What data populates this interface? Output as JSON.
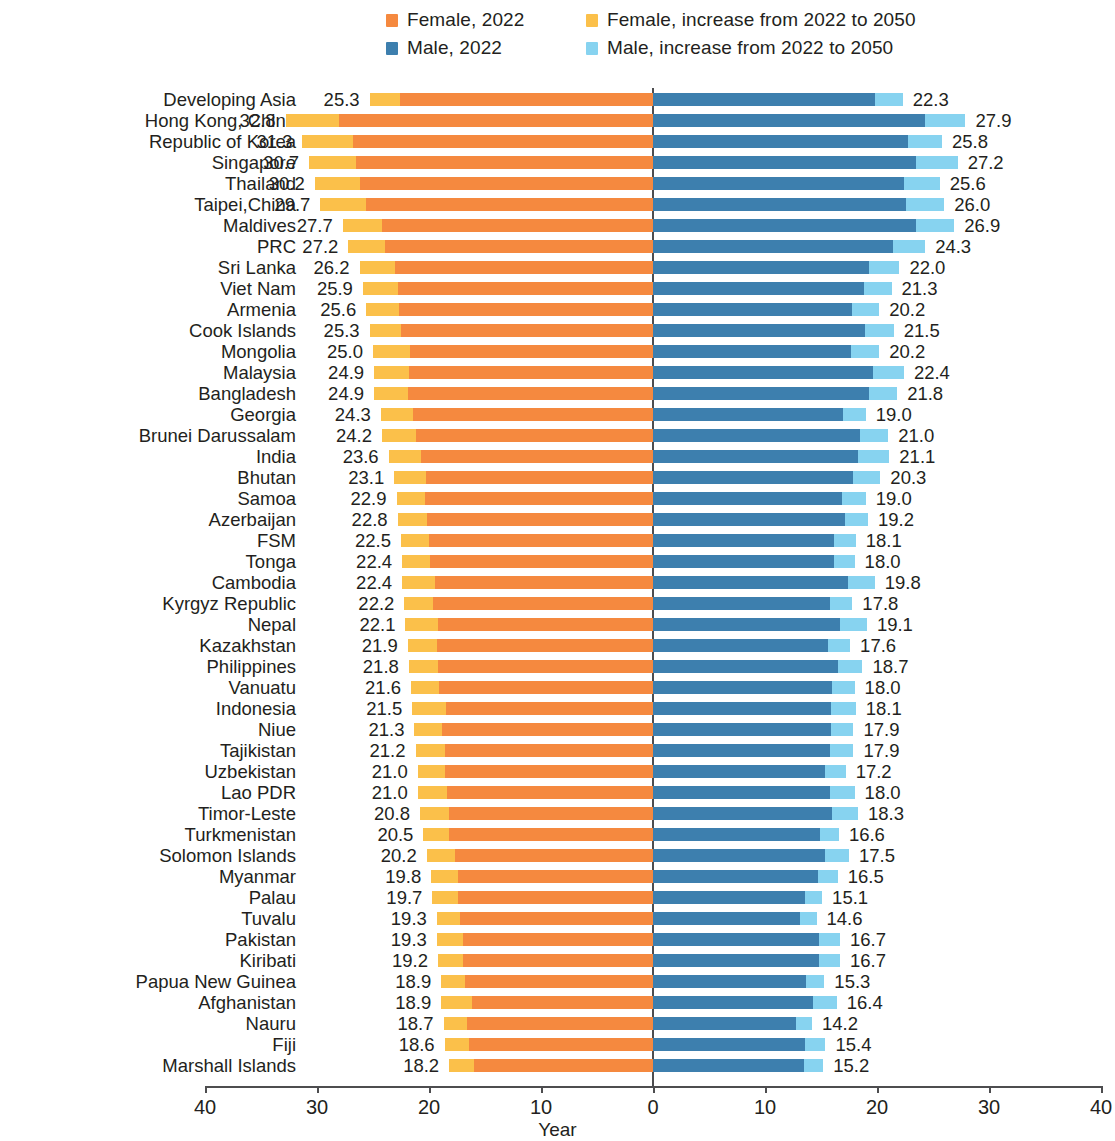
{
  "legend": {
    "items": [
      {
        "label": "Female, 2022",
        "color": "#f5893f"
      },
      {
        "label": "Female, increase from 2022 to 2050",
        "color": "#fbc04a"
      },
      {
        "label": "Male, 2022",
        "color": "#3d7fae"
      },
      {
        "label": "Male, increase from 2022 to 2050",
        "color": "#87d3f0"
      }
    ]
  },
  "axis": {
    "title": "Year",
    "ticks": [
      "40",
      "30",
      "20",
      "10",
      "0",
      "10",
      "20",
      "30",
      "40"
    ]
  },
  "chart_data": {
    "type": "bar",
    "subtype": "diverging-stacked-horizontal",
    "title": "",
    "xlabel": "Year",
    "ylabel": "",
    "xlim": [
      -40,
      40
    ],
    "grid": false,
    "legend_position": "top",
    "axis_ticks": [
      40,
      30,
      20,
      10,
      0,
      10,
      20,
      30,
      40
    ],
    "series": [
      {
        "name": "Female, 2022",
        "color": "#f5893f",
        "side": "left"
      },
      {
        "name": "Female, increase from 2022 to 2050",
        "color": "#fbc04a",
        "side": "left"
      },
      {
        "name": "Male, 2022",
        "color": "#3d7fae",
        "side": "right"
      },
      {
        "name": "Male, increase from 2022 to 2050",
        "color": "#87d3f0",
        "side": "right"
      }
    ],
    "categories": [
      "Developing Asia",
      "Hong Kong, China",
      "Republic of Korea",
      "Singapore",
      "Thailand",
      "Taipei,China",
      "Maldives",
      "PRC",
      "Sri Lanka",
      "Viet Nam",
      "Armenia",
      "Cook Islands",
      "Mongolia",
      "Malaysia",
      "Bangladesh",
      "Georgia",
      "Brunei Darussalam",
      "India",
      "Bhutan",
      "Samoa",
      "Azerbaijan",
      "FSM",
      "Tonga",
      "Cambodia",
      "Kyrgyz Republic",
      "Nepal",
      "Kazakhstan",
      "Philippines",
      "Vanuatu",
      "Indonesia",
      "Niue",
      "Tajikistan",
      "Uzbekistan",
      "Lao PDR",
      "Timor-Leste",
      "Turkmenistan",
      "Solomon Islands",
      "Myanmar",
      "Palau",
      "Tuvalu",
      "Pakistan",
      "Kiribati",
      "Papua New Guinea",
      "Afghanistan",
      "Nauru",
      "Fiji",
      "Marshall Islands"
    ],
    "female_total_2050": [
      25.3,
      32.8,
      31.3,
      30.7,
      30.2,
      29.7,
      27.7,
      27.2,
      26.2,
      25.9,
      25.6,
      25.3,
      25.0,
      24.9,
      24.9,
      24.3,
      24.2,
      23.6,
      23.1,
      22.9,
      22.8,
      22.5,
      22.4,
      22.4,
      22.2,
      22.1,
      21.9,
      21.8,
      21.6,
      21.5,
      21.3,
      21.2,
      21.0,
      21.0,
      20.8,
      20.5,
      20.2,
      19.8,
      19.7,
      19.3,
      19.3,
      19.2,
      18.9,
      18.9,
      18.7,
      18.6,
      18.2
    ],
    "female_2022": [
      22.6,
      28.0,
      26.8,
      26.5,
      26.2,
      25.6,
      24.2,
      23.9,
      23.0,
      22.8,
      22.7,
      22.5,
      21.7,
      21.8,
      21.9,
      21.4,
      21.2,
      20.7,
      20.3,
      20.4,
      20.2,
      20.0,
      19.9,
      19.5,
      19.6,
      19.2,
      19.3,
      19.2,
      19.1,
      18.5,
      18.8,
      18.6,
      18.6,
      18.4,
      18.2,
      18.2,
      17.7,
      17.4,
      17.4,
      17.2,
      17.0,
      17.0,
      16.8,
      16.2,
      16.6,
      16.4,
      16.0
    ],
    "female_increase": [
      2.7,
      4.8,
      4.5,
      4.2,
      4.0,
      4.1,
      3.5,
      3.3,
      3.2,
      3.1,
      2.9,
      2.8,
      3.3,
      3.1,
      3.0,
      2.9,
      3.0,
      2.9,
      2.8,
      2.5,
      2.6,
      2.5,
      2.5,
      2.9,
      2.6,
      2.9,
      2.6,
      2.6,
      2.5,
      3.0,
      2.5,
      2.6,
      2.4,
      2.6,
      2.6,
      2.3,
      2.5,
      2.4,
      2.3,
      2.1,
      2.3,
      2.2,
      2.1,
      2.7,
      2.1,
      2.2,
      2.2
    ],
    "male_total_2050": [
      22.3,
      27.9,
      25.8,
      27.2,
      25.6,
      26.0,
      26.9,
      24.3,
      22.0,
      21.3,
      20.2,
      21.5,
      20.2,
      22.4,
      21.8,
      19.0,
      21.0,
      21.1,
      20.3,
      19.0,
      19.2,
      18.1,
      18.0,
      19.8,
      17.8,
      19.1,
      17.6,
      18.7,
      18.0,
      18.1,
      17.9,
      17.9,
      17.2,
      18.0,
      18.3,
      16.6,
      17.5,
      16.5,
      15.1,
      14.6,
      16.7,
      16.7,
      15.3,
      16.4,
      14.2,
      15.4,
      15.2
    ],
    "male_2022": [
      19.8,
      24.3,
      22.8,
      23.5,
      22.4,
      22.6,
      23.5,
      21.4,
      19.3,
      18.8,
      17.8,
      18.9,
      17.7,
      19.6,
      19.3,
      17.0,
      18.5,
      18.3,
      17.9,
      16.9,
      17.1,
      16.2,
      16.2,
      17.4,
      15.8,
      16.7,
      15.6,
      16.5,
      16.0,
      15.9,
      15.9,
      15.8,
      15.4,
      15.8,
      16.0,
      14.9,
      15.4,
      14.7,
      13.6,
      13.1,
      14.8,
      14.8,
      13.7,
      14.3,
      12.8,
      13.6,
      13.5
    ],
    "male_increase": [
      2.5,
      3.6,
      3.0,
      3.7,
      3.2,
      3.4,
      3.4,
      2.9,
      2.7,
      2.5,
      2.4,
      2.6,
      2.5,
      2.8,
      2.5,
      2.0,
      2.5,
      2.8,
      2.4,
      2.1,
      2.1,
      1.9,
      1.8,
      2.4,
      2.0,
      2.4,
      2.0,
      2.2,
      2.0,
      2.2,
      2.0,
      2.1,
      1.8,
      2.2,
      2.3,
      1.7,
      2.1,
      1.8,
      1.5,
      1.5,
      1.9,
      1.9,
      1.6,
      2.1,
      1.4,
      1.8,
      1.7
    ]
  }
}
